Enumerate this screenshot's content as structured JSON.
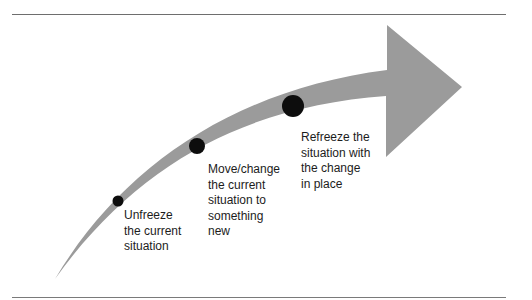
{
  "diagram": {
    "colors": {
      "arrow": "#9b9b9b",
      "dot": "#0d0d0d",
      "text": "#1c1c1c",
      "rule": "#6e6e6e"
    },
    "stages": [
      {
        "id": "unfreeze",
        "label": "Unfreeze\nthe current\nsituation",
        "dot": {
          "cx": 118,
          "cy": 201,
          "r": 5.5
        },
        "text_pos": {
          "x": 124,
          "y": 208
        }
      },
      {
        "id": "move",
        "label": "Move/change\nthe current\nsituation to\nsomething\nnew",
        "dot": {
          "cx": 197,
          "cy": 146,
          "r": 8
        },
        "text_pos": {
          "x": 208,
          "y": 162
        }
      },
      {
        "id": "refreeze",
        "label": "Refreeze the\nsituation with\nthe change\nin place",
        "dot": {
          "cx": 293,
          "cy": 106,
          "r": 11
        },
        "text_pos": {
          "x": 301,
          "y": 130
        }
      }
    ]
  }
}
